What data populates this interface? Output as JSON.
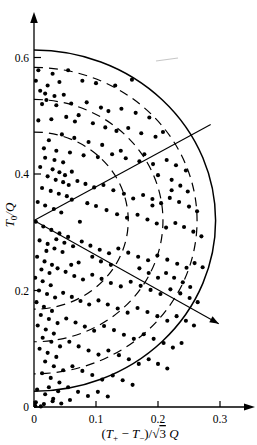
{
  "figure": {
    "title": "",
    "width": 257,
    "height": 445,
    "background": "#ffffff",
    "ink_color": "#000000"
  },
  "axes": {
    "x": {
      "label_parts": {
        "numerator_left": "T",
        "numerator_left_sub": "+",
        "minus": "−",
        "numerator_right": "T",
        "numerator_right_sub": "−",
        "denominator": "√3",
        "denominator_sym": "Q"
      },
      "label_text": "(T+ − T−)/√3 Q",
      "ticks": [
        "0",
        "0.1",
        "0.2",
        "0.3"
      ],
      "tick_values": [
        0,
        0.1,
        0.2,
        0.3
      ],
      "range": [
        0,
        0.355
      ],
      "arrow": true
    },
    "y": {
      "label_text": "T0/Q",
      "label_sym": "T",
      "label_sub": "0",
      "label_den": "Q",
      "ticks": [
        "0",
        "0.2",
        "0.4",
        "0.6"
      ],
      "tick_values": [
        0,
        0.2,
        0.4,
        0.6
      ],
      "range": [
        0,
        0.695
      ],
      "arrow": true
    }
  },
  "annotations": {
    "radial_line_upper": {
      "name": "radial-line-upper",
      "angle_deg": 30
    },
    "radial_line_lower": {
      "name": "radial-line-lower",
      "angle_deg": -30,
      "arrowhead": true
    },
    "center": {
      "x": 0.0,
      "y": 0.32
    },
    "smudge": {
      "x": 0.215,
      "y": 0.615
    }
  },
  "chart_data": {
    "type": "scatter",
    "title": "",
    "xlabel": "(T+ − T−)/√3 Q",
    "ylabel": "T0/Q",
    "xlim": [
      0,
      0.355
    ],
    "ylim": [
      0,
      0.695
    ],
    "grid": false,
    "legend": null,
    "curves": [
      {
        "name": "outer-boundary-arc",
        "style": "solid",
        "type": "semicircle",
        "cx": 0.0,
        "cy": 0.32,
        "r": 0.293,
        "note": "solid envelope arc from (0,0.613) through (0.293,0.32) to (0,0.0)"
      },
      {
        "name": "dashed-arc-1",
        "style": "dashed",
        "type": "semicircle",
        "cx": 0.0,
        "cy": 0.32,
        "r": 0.263
      },
      {
        "name": "dashed-arc-2",
        "style": "dashed",
        "type": "semicircle",
        "cx": 0.0,
        "cy": 0.32,
        "r": 0.208
      },
      {
        "name": "dashed-arc-3",
        "style": "dashed",
        "type": "semicircle",
        "cx": 0.0,
        "cy": 0.32,
        "r": 0.152
      }
    ],
    "lines": [
      {
        "name": "radial-upper",
        "x": [
          0.0,
          0.285
        ],
        "y": [
          0.32,
          0.485
        ]
      },
      {
        "name": "radial-lower",
        "x": [
          0.0,
          0.298
        ],
        "y": [
          0.32,
          0.143
        ],
        "arrow": true
      }
    ],
    "points": [
      [
        0.007,
        0.578
      ],
      [
        0.03,
        0.572
      ],
      [
        0.055,
        0.578
      ],
      [
        0.003,
        0.56
      ],
      [
        0.022,
        0.552
      ],
      [
        0.041,
        0.558
      ],
      [
        0.078,
        0.56
      ],
      [
        0.1,
        0.556
      ],
      [
        0.131,
        0.552
      ],
      [
        0.158,
        0.562
      ],
      [
        0.01,
        0.543
      ],
      [
        0.018,
        0.538
      ],
      [
        0.033,
        0.534
      ],
      [
        0.048,
        0.536
      ],
      [
        0.02,
        0.527
      ],
      [
        0.013,
        0.52
      ],
      [
        0.036,
        0.518
      ],
      [
        0.06,
        0.521
      ],
      [
        0.085,
        0.523
      ],
      [
        0.108,
        0.514
      ],
      [
        0.12,
        0.508
      ],
      [
        0.141,
        0.512
      ],
      [
        0.164,
        0.505
      ],
      [
        0.186,
        0.497
      ],
      [
        0.072,
        0.501
      ],
      [
        0.052,
        0.498
      ],
      [
        0.028,
        0.494
      ],
      [
        0.007,
        0.492
      ],
      [
        0.095,
        0.487
      ],
      [
        0.115,
        0.48
      ],
      [
        0.133,
        0.474
      ],
      [
        0.152,
        0.479
      ],
      [
        0.173,
        0.47
      ],
      [
        0.196,
        0.464
      ],
      [
        0.208,
        0.472
      ],
      [
        0.045,
        0.468
      ],
      [
        0.065,
        0.462
      ],
      [
        0.024,
        0.458
      ],
      [
        0.088,
        0.455
      ],
      [
        0.11,
        0.45
      ],
      [
        0.016,
        0.444
      ],
      [
        0.036,
        0.44
      ],
      [
        0.058,
        0.437
      ],
      [
        0.08,
        0.432
      ],
      [
        0.103,
        0.429
      ],
      [
        0.126,
        0.434
      ],
      [
        0.148,
        0.427
      ],
      [
        0.17,
        0.422
      ],
      [
        0.192,
        0.417
      ],
      [
        0.214,
        0.424
      ],
      [
        0.229,
        0.415
      ],
      [
        0.245,
        0.406
      ],
      [
        0.01,
        0.412
      ],
      [
        0.03,
        0.408
      ],
      [
        0.041,
        0.403
      ],
      [
        0.05,
        0.398
      ],
      [
        0.061,
        0.404
      ],
      [
        0.022,
        0.396
      ],
      [
        0.035,
        0.39
      ],
      [
        0.047,
        0.386
      ],
      [
        0.056,
        0.381
      ],
      [
        0.07,
        0.388
      ],
      [
        0.083,
        0.383
      ],
      [
        0.097,
        0.377
      ],
      [
        0.112,
        0.381
      ],
      [
        0.013,
        0.376
      ],
      [
        0.027,
        0.371
      ],
      [
        0.04,
        0.366
      ],
      [
        0.053,
        0.362
      ],
      [
        0.128,
        0.372
      ],
      [
        0.145,
        0.366
      ],
      [
        0.16,
        0.358
      ],
      [
        0.176,
        0.364
      ],
      [
        0.191,
        0.357
      ],
      [
        0.205,
        0.35
      ],
      [
        0.219,
        0.359
      ],
      [
        0.234,
        0.352
      ],
      [
        0.25,
        0.344
      ],
      [
        0.263,
        0.336
      ],
      [
        0.006,
        0.352
      ],
      [
        0.018,
        0.346
      ],
      [
        0.032,
        0.34
      ],
      [
        0.044,
        0.334
      ],
      [
        0.1,
        0.345
      ],
      [
        0.117,
        0.338
      ],
      [
        0.134,
        0.331
      ],
      [
        0.15,
        0.325
      ],
      [
        0.167,
        0.33
      ],
      [
        0.183,
        0.322
      ],
      [
        0.198,
        0.315
      ],
      [
        0.213,
        0.308
      ],
      [
        0.228,
        0.316
      ],
      [
        0.242,
        0.309
      ],
      [
        0.257,
        0.301
      ],
      [
        0.27,
        0.293
      ],
      [
        0.003,
        0.318
      ],
      [
        0.015,
        0.31
      ],
      [
        0.028,
        0.304
      ],
      [
        0.041,
        0.298
      ],
      [
        0.055,
        0.292
      ],
      [
        0.009,
        0.286
      ],
      [
        0.022,
        0.28
      ],
      [
        0.036,
        0.288
      ],
      [
        0.049,
        0.282
      ],
      [
        0.063,
        0.276
      ],
      [
        0.077,
        0.284
      ],
      [
        0.091,
        0.277
      ],
      [
        0.106,
        0.27
      ],
      [
        0.121,
        0.264
      ],
      [
        0.136,
        0.272
      ],
      [
        0.152,
        0.265
      ],
      [
        0.168,
        0.258
      ],
      [
        0.184,
        0.252
      ],
      [
        0.199,
        0.26
      ],
      [
        0.215,
        0.253
      ],
      [
        0.231,
        0.246
      ],
      [
        0.246,
        0.239
      ],
      [
        0.259,
        0.247
      ],
      [
        0.272,
        0.24
      ],
      [
        0.005,
        0.258
      ],
      [
        0.017,
        0.25
      ],
      [
        0.029,
        0.244
      ],
      [
        0.012,
        0.236
      ],
      [
        0.025,
        0.23
      ],
      [
        0.038,
        0.238
      ],
      [
        0.051,
        0.232
      ],
      [
        0.065,
        0.225
      ],
      [
        0.079,
        0.219
      ],
      [
        0.094,
        0.227
      ],
      [
        0.109,
        0.22
      ],
      [
        0.124,
        0.213
      ],
      [
        0.14,
        0.207
      ],
      [
        0.156,
        0.215
      ],
      [
        0.172,
        0.208
      ],
      [
        0.188,
        0.201
      ],
      [
        0.204,
        0.194
      ],
      [
        0.22,
        0.202
      ],
      [
        0.236,
        0.195
      ],
      [
        0.251,
        0.187
      ],
      [
        0.264,
        0.18
      ],
      [
        0.002,
        0.222
      ],
      [
        0.014,
        0.216
      ],
      [
        0.027,
        0.209
      ],
      [
        0.008,
        0.2
      ],
      [
        0.021,
        0.194
      ],
      [
        0.034,
        0.188
      ],
      [
        0.047,
        0.196
      ],
      [
        0.061,
        0.189
      ],
      [
        0.075,
        0.182
      ],
      [
        0.089,
        0.176
      ],
      [
        0.104,
        0.183
      ],
      [
        0.119,
        0.176
      ],
      [
        0.135,
        0.169
      ],
      [
        0.151,
        0.162
      ],
      [
        0.167,
        0.17
      ],
      [
        0.183,
        0.163
      ],
      [
        0.199,
        0.156
      ],
      [
        0.215,
        0.148
      ],
      [
        0.23,
        0.156
      ],
      [
        0.245,
        0.148
      ],
      [
        0.258,
        0.14
      ],
      [
        0.004,
        0.18
      ],
      [
        0.016,
        0.172
      ],
      [
        0.029,
        0.165
      ],
      [
        0.011,
        0.158
      ],
      [
        0.024,
        0.151
      ],
      [
        0.038,
        0.144
      ],
      [
        0.052,
        0.152
      ],
      [
        0.067,
        0.145
      ],
      [
        0.082,
        0.138
      ],
      [
        0.097,
        0.131
      ],
      [
        0.113,
        0.139
      ],
      [
        0.129,
        0.132
      ],
      [
        0.145,
        0.124
      ],
      [
        0.161,
        0.117
      ],
      [
        0.177,
        0.125
      ],
      [
        0.193,
        0.117
      ],
      [
        0.209,
        0.11
      ],
      [
        0.224,
        0.102
      ],
      [
        0.238,
        0.11
      ],
      [
        0.006,
        0.14
      ],
      [
        0.019,
        0.133
      ],
      [
        0.032,
        0.126
      ],
      [
        0.014,
        0.119
      ],
      [
        0.028,
        0.112
      ],
      [
        0.042,
        0.104
      ],
      [
        0.057,
        0.112
      ],
      [
        0.072,
        0.104
      ],
      [
        0.088,
        0.097
      ],
      [
        0.104,
        0.09
      ],
      [
        0.12,
        0.097
      ],
      [
        0.137,
        0.089
      ],
      [
        0.153,
        0.082
      ],
      [
        0.169,
        0.074
      ],
      [
        0.185,
        0.082
      ],
      [
        0.2,
        0.074
      ],
      [
        0.215,
        0.066
      ],
      [
        0.009,
        0.1
      ],
      [
        0.022,
        0.093
      ],
      [
        0.036,
        0.086
      ],
      [
        0.018,
        0.078
      ],
      [
        0.032,
        0.07
      ],
      [
        0.047,
        0.063
      ],
      [
        0.062,
        0.07
      ],
      [
        0.078,
        0.062
      ],
      [
        0.094,
        0.055
      ],
      [
        0.11,
        0.047
      ],
      [
        0.127,
        0.054
      ],
      [
        0.143,
        0.046
      ],
      [
        0.159,
        0.038
      ],
      [
        0.013,
        0.058
      ],
      [
        0.027,
        0.05
      ],
      [
        0.041,
        0.042
      ],
      [
        0.024,
        0.034
      ],
      [
        0.039,
        0.027
      ],
      [
        0.055,
        0.034
      ],
      [
        0.071,
        0.026
      ],
      [
        0.087,
        0.019
      ],
      [
        0.103,
        0.026
      ],
      [
        0.119,
        0.018
      ],
      [
        0.005,
        0.03
      ],
      [
        0.018,
        0.022
      ],
      [
        0.031,
        0.014
      ],
      [
        0.003,
        0.008
      ],
      [
        0.016,
        0.005
      ],
      [
        0.03,
        0.01
      ],
      [
        0.044,
        0.006
      ],
      [
        0.058,
        0.012
      ],
      [
        0.002,
        0.002
      ],
      [
        0.011,
        0.001
      ],
      [
        0.066,
        0.49
      ],
      [
        0.14,
        0.44
      ],
      [
        0.178,
        0.434
      ],
      [
        0.2,
        0.398
      ],
      [
        0.222,
        0.39
      ],
      [
        0.222,
        0.372
      ],
      [
        0.236,
        0.38
      ],
      [
        0.248,
        0.37
      ],
      [
        0.191,
        0.346
      ],
      [
        0.086,
        0.35
      ],
      [
        0.074,
        0.318
      ],
      [
        0.061,
        0.356
      ],
      [
        0.047,
        0.42
      ],
      [
        0.033,
        0.424
      ],
      [
        0.018,
        0.428
      ],
      [
        0.06,
        0.244
      ],
      [
        0.046,
        0.266
      ],
      [
        0.033,
        0.272
      ],
      [
        0.02,
        0.268
      ],
      [
        0.072,
        0.248
      ],
      [
        0.17,
        0.238
      ],
      [
        0.185,
        0.23
      ],
      [
        0.2,
        0.222
      ],
      [
        0.213,
        0.23
      ],
      [
        0.226,
        0.222
      ],
      [
        0.24,
        0.214
      ],
      [
        0.252,
        0.206
      ],
      [
        0.094,
        0.258
      ],
      [
        0.108,
        0.25
      ],
      [
        0.124,
        0.244
      ]
    ]
  }
}
